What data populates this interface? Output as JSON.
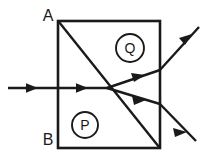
{
  "figure": {
    "type": "ray-optics-diagram",
    "background_color": "#ffffff",
    "ink_color": "#1a1a1a"
  },
  "prism": {
    "name": "square-block",
    "corners": {
      "top_left": {
        "x": 58,
        "y": 21
      },
      "top_right": {
        "x": 160,
        "y": 21
      },
      "bottom_right": {
        "x": 160,
        "y": 148
      },
      "bottom_left": {
        "x": 58,
        "y": 148
      }
    }
  },
  "interface": {
    "name": "diagonal-interface",
    "from": {
      "x": 58,
      "y": 21
    },
    "to": {
      "x": 160,
      "y": 148
    }
  },
  "labels": {
    "corner_top": {
      "text": "A",
      "x": 48,
      "y": 17
    },
    "corner_bottom": {
      "text": "B",
      "x": 48,
      "y": 141
    },
    "region_lower": {
      "text": "P",
      "x": 85,
      "y": 125,
      "radius": 13
    },
    "region_upper": {
      "text": "Q",
      "x": 130,
      "y": 48,
      "radius": 14
    }
  },
  "rays": {
    "incident": {
      "name": "incident-ray",
      "from": {
        "x": 8,
        "y": 88
      },
      "to": {
        "x": 108,
        "y": 88
      },
      "arrow_positions": [
        {
          "x": 38,
          "y": 88
        },
        {
          "x": 88,
          "y": 88
        }
      ]
    },
    "refracted_upper": {
      "name": "refracted-ray-upper",
      "segment_inside": {
        "from": {
          "x": 108,
          "y": 88
        },
        "to": {
          "x": 160,
          "y": 70
        }
      },
      "segment_outside": {
        "from": {
          "x": 160,
          "y": 70
        },
        "to": {
          "x": 199,
          "y": 27
        }
      },
      "arrow_positions": [
        {
          "x": 142,
          "y": 76
        },
        {
          "x": 190,
          "y": 36
        }
      ]
    },
    "refracted_lower": {
      "name": "refracted-ray-lower",
      "segment_inside": {
        "from": {
          "x": 108,
          "y": 88
        },
        "to": {
          "x": 160,
          "y": 104
        }
      },
      "segment_outside": {
        "from": {
          "x": 160,
          "y": 104
        },
        "to": {
          "x": 196,
          "y": 141
        }
      },
      "arrow_positions": [
        {
          "x": 143,
          "y": 99
        },
        {
          "x": 184,
          "y": 129
        }
      ]
    },
    "junction": {
      "x": 108,
      "y": 88,
      "name": "split-point"
    }
  }
}
